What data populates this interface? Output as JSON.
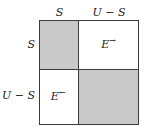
{
  "diagram": {
    "type": "matrix-2x2",
    "shade_color": "#c9c9c9",
    "border_color": "#3b3b3b",
    "background_color": "#ffffff",
    "text_color": "#1a1a1a",
    "column_headers": [
      {
        "label": "S"
      },
      {
        "label": "U − S"
      }
    ],
    "row_headers": [
      {
        "label": "S"
      },
      {
        "label": "U − S"
      }
    ],
    "cells": [
      {
        "row": 0,
        "col": 0,
        "label": "",
        "arrow": "",
        "shaded": true
      },
      {
        "row": 0,
        "col": 1,
        "label": "E",
        "arrow": "→",
        "shaded": false
      },
      {
        "row": 1,
        "col": 0,
        "label": "E",
        "arrow": "←",
        "shaded": false
      },
      {
        "row": 1,
        "col": 1,
        "label": "",
        "arrow": "",
        "shaded": true
      }
    ]
  }
}
